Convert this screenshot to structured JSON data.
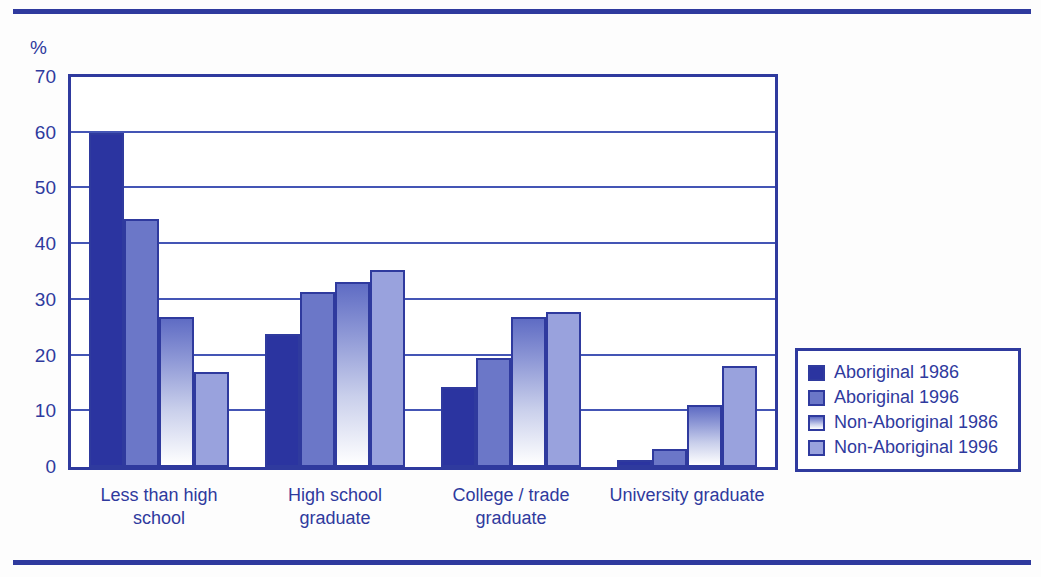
{
  "figure": {
    "axis_unit_label": "%",
    "accent_color": "#2f3a9e",
    "series_colors": [
      "#2b34a0",
      "#6b77c8",
      "#c9cfeb",
      "#99a2dd"
    ]
  },
  "legend": {
    "position": "right",
    "entries": [
      {
        "label": "Aboriginal 1986",
        "swatch": "legend-swatch-aboriginal-1986"
      },
      {
        "label": "Aboriginal 1996",
        "swatch": "legend-swatch-aboriginal-1996"
      },
      {
        "label": "Non-Aboriginal 1986",
        "swatch": "legend-swatch-non-aboriginal-1986"
      },
      {
        "label": "Non-Aboriginal 1996",
        "swatch": "legend-swatch-non-aboriginal-1996"
      }
    ]
  },
  "chart_data": {
    "type": "bar",
    "title": "",
    "xlabel": "",
    "ylabel": "%",
    "ylim": [
      0,
      70
    ],
    "yticks": [
      0,
      10,
      20,
      30,
      40,
      50,
      60,
      70
    ],
    "ytick_labels": [
      "0",
      "10",
      "20",
      "30",
      "40",
      "50",
      "60",
      "70"
    ],
    "grid": true,
    "grid_axis": "y",
    "legend_position": "right",
    "categories": [
      "Less than high school",
      "High school graduate",
      "College / trade graduate",
      "University graduate"
    ],
    "category_lines": [
      [
        "Less than high",
        "school"
      ],
      [
        "High school",
        "graduate"
      ],
      [
        "College / trade",
        "graduate"
      ],
      [
        "University graduate",
        ""
      ]
    ],
    "series": [
      {
        "name": "Aboriginal 1986",
        "color": "#2b34a0",
        "values": [
          60.0,
          23.8,
          14.3,
          1.2
        ]
      },
      {
        "name": "Aboriginal 1996",
        "color": "#6b77c8",
        "values": [
          44.5,
          31.5,
          19.5,
          3.3
        ]
      },
      {
        "name": "Non-Aboriginal 1986",
        "color": "#c9cfeb",
        "values": [
          27.0,
          33.2,
          27.0,
          11.2
        ]
      },
      {
        "name": "Non-Aboriginal 1996",
        "color": "#99a2dd",
        "values": [
          17.0,
          35.3,
          27.8,
          18.2
        ]
      }
    ]
  }
}
